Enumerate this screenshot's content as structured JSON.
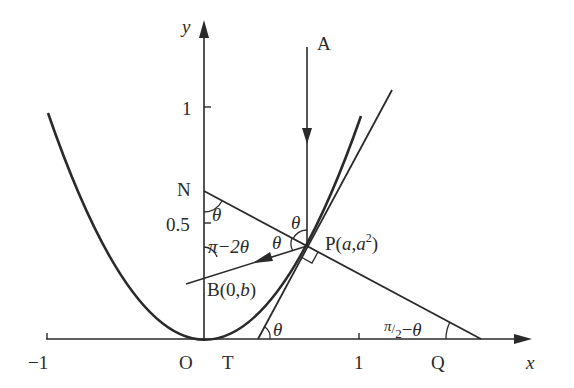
{
  "diagram": {
    "colors": {
      "ink": "#2a2a2a",
      "background": "#ffffff"
    },
    "axes": {
      "x_label": "x",
      "y_label": "y",
      "x_ticks": [
        {
          "value": -1,
          "label": "−1"
        },
        {
          "value": 1,
          "label": "1"
        }
      ],
      "y_ticks": [
        {
          "value": 0.5,
          "label": "0.5"
        },
        {
          "value": 1,
          "label": "1"
        }
      ]
    },
    "curve": {
      "equation": "y = x^2",
      "x_range": [
        -0.95,
        1.0
      ]
    },
    "points": {
      "origin": "O",
      "T": "T",
      "Q": "Q",
      "N": "N",
      "B": "B(0,b)",
      "B_main": "B",
      "B_coord": "(0,",
      "B_b": "b",
      "B_close": ")",
      "P": "P",
      "P_open": "(",
      "P_a": "a",
      "P_comma": ",",
      "P_a2": "a",
      "P_exp": "2",
      "P_close": ")",
      "A": "A"
    },
    "angles": {
      "theta_symbol": "θ",
      "pi_minus_2theta": "π−2θ",
      "pi_symbol": "π",
      "minus_2": "−2",
      "half_over": "/",
      "half_denominator": "2",
      "minus": "−"
    },
    "lines": [
      {
        "name": "incident-ray",
        "from": "A",
        "to": "P",
        "direction": "downward"
      },
      {
        "name": "reflected-ray",
        "from": "P",
        "to": "B",
        "direction": "toward B"
      },
      {
        "name": "tangent-line",
        "through": [
          "T",
          "P"
        ]
      },
      {
        "name": "normal-line",
        "through": [
          "N",
          "P",
          "Q"
        ]
      }
    ]
  }
}
